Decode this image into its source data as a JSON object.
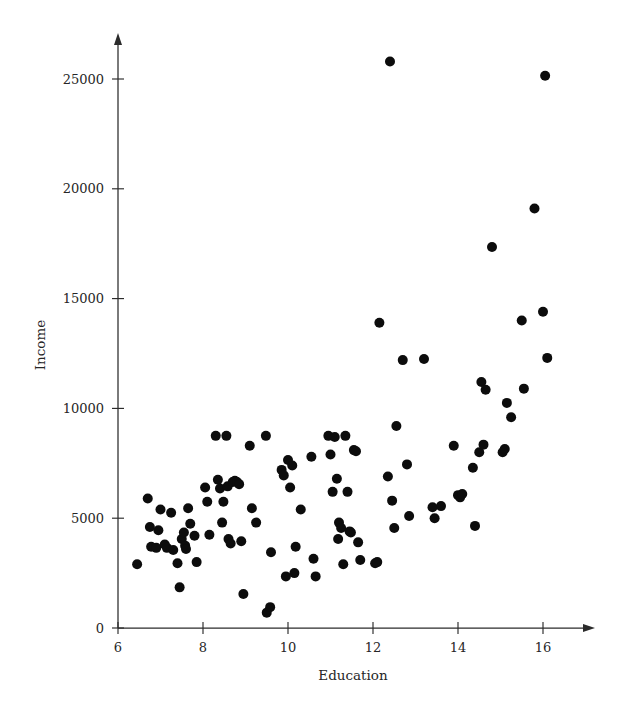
{
  "figure": {
    "width": 617,
    "height": 728,
    "background": "#ffffff",
    "marker_color": "#0c0c0c",
    "axis_color": "#2b2b2b",
    "text_color": "#262626"
  },
  "chart_data": {
    "type": "scatter",
    "title": "",
    "xlabel": "Education",
    "ylabel": "Income",
    "xlim": [
      6,
      17.2
    ],
    "ylim": [
      0,
      26800
    ],
    "xticks": [
      6,
      8,
      10,
      12,
      14,
      16
    ],
    "xticklabels": [
      "6",
      "8",
      "10",
      "12",
      "14",
      "16"
    ],
    "yticks": [
      0,
      5000,
      10000,
      15000,
      20000,
      25000
    ],
    "yticklabels": [
      "0",
      "5000",
      "10000",
      "15000",
      "20000",
      "25000"
    ],
    "grid": false,
    "legend": null,
    "marker": "filled-circle",
    "marker_size": 5.0,
    "n_points": 110,
    "points": [
      [
        6.45,
        2900
      ],
      [
        6.7,
        5900
      ],
      [
        6.75,
        4600
      ],
      [
        6.78,
        3700
      ],
      [
        6.9,
        3650
      ],
      [
        6.95,
        4450
      ],
      [
        7.0,
        5400
      ],
      [
        7.1,
        3800
      ],
      [
        7.15,
        3650
      ],
      [
        7.25,
        5250
      ],
      [
        7.3,
        3550
      ],
      [
        7.4,
        2950
      ],
      [
        7.45,
        1850
      ],
      [
        7.5,
        4050
      ],
      [
        7.55,
        4350
      ],
      [
        7.58,
        3750
      ],
      [
        7.6,
        3600
      ],
      [
        7.65,
        5450
      ],
      [
        7.7,
        4750
      ],
      [
        7.8,
        4200
      ],
      [
        7.85,
        3000
      ],
      [
        8.05,
        6400
      ],
      [
        8.1,
        5750
      ],
      [
        8.15,
        4250
      ],
      [
        8.3,
        8750
      ],
      [
        8.35,
        6750
      ],
      [
        8.4,
        6350
      ],
      [
        8.45,
        4800
      ],
      [
        8.48,
        5750
      ],
      [
        8.55,
        8750
      ],
      [
        8.58,
        6450
      ],
      [
        8.6,
        4050
      ],
      [
        8.65,
        3850
      ],
      [
        8.7,
        6650
      ],
      [
        8.75,
        6700
      ],
      [
        8.8,
        6650
      ],
      [
        8.85,
        6550
      ],
      [
        8.9,
        3950
      ],
      [
        8.95,
        1550
      ],
      [
        9.1,
        8300
      ],
      [
        9.15,
        5450
      ],
      [
        9.25,
        4800
      ],
      [
        9.48,
        8750
      ],
      [
        9.5,
        700
      ],
      [
        9.58,
        950
      ],
      [
        9.6,
        3450
      ],
      [
        9.85,
        7200
      ],
      [
        9.9,
        6950
      ],
      [
        9.95,
        2350
      ],
      [
        10.0,
        7650
      ],
      [
        10.05,
        6400
      ],
      [
        10.1,
        7400
      ],
      [
        10.15,
        2500
      ],
      [
        10.18,
        3700
      ],
      [
        10.3,
        5400
      ],
      [
        10.55,
        7800
      ],
      [
        10.6,
        3150
      ],
      [
        10.65,
        2350
      ],
      [
        10.95,
        8750
      ],
      [
        11.0,
        7900
      ],
      [
        11.05,
        6200
      ],
      [
        11.1,
        8700
      ],
      [
        11.15,
        6800
      ],
      [
        11.18,
        4050
      ],
      [
        11.2,
        4800
      ],
      [
        11.25,
        4550
      ],
      [
        11.3,
        2900
      ],
      [
        11.35,
        8750
      ],
      [
        11.4,
        6200
      ],
      [
        11.45,
        4400
      ],
      [
        11.48,
        4350
      ],
      [
        11.55,
        8100
      ],
      [
        11.6,
        8050
      ],
      [
        11.65,
        3900
      ],
      [
        11.7,
        3100
      ],
      [
        12.05,
        2950
      ],
      [
        12.1,
        3000
      ],
      [
        12.15,
        13900
      ],
      [
        12.35,
        6900
      ],
      [
        12.4,
        25800
      ],
      [
        12.45,
        5800
      ],
      [
        12.5,
        4550
      ],
      [
        12.55,
        9200
      ],
      [
        12.7,
        12200
      ],
      [
        12.8,
        7450
      ],
      [
        12.85,
        5100
      ],
      [
        13.2,
        12250
      ],
      [
        13.4,
        5500
      ],
      [
        13.45,
        5000
      ],
      [
        13.6,
        5550
      ],
      [
        13.9,
        8300
      ],
      [
        14.0,
        6050
      ],
      [
        14.05,
        5950
      ],
      [
        14.1,
        6100
      ],
      [
        14.35,
        7300
      ],
      [
        14.4,
        4650
      ],
      [
        14.5,
        8000
      ],
      [
        14.55,
        11200
      ],
      [
        14.6,
        8350
      ],
      [
        14.65,
        10850
      ],
      [
        14.8,
        17350
      ],
      [
        15.05,
        8000
      ],
      [
        15.1,
        8150
      ],
      [
        15.15,
        10250
      ],
      [
        15.25,
        9600
      ],
      [
        15.5,
        14000
      ],
      [
        15.55,
        10900
      ],
      [
        15.8,
        19100
      ],
      [
        16.0,
        14400
      ],
      [
        16.05,
        25150
      ],
      [
        16.1,
        12300
      ]
    ]
  }
}
